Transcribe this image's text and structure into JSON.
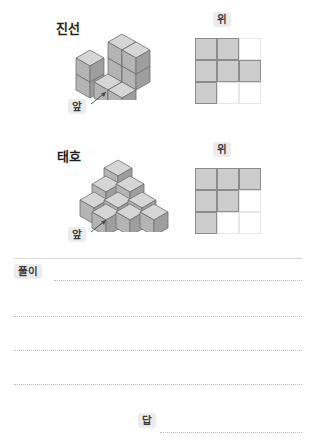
{
  "worksheet": {
    "problems": [
      {
        "student_name": "진선",
        "front_label": "앞",
        "top_label": "위",
        "top_view_grid": {
          "rows": 3,
          "cols": 3,
          "filled": [
            [
              true,
              true,
              false
            ],
            [
              true,
              true,
              true
            ],
            [
              true,
              false,
              false
            ]
          ]
        },
        "cube_count": 9
      },
      {
        "student_name": "태호",
        "front_label": "앞",
        "top_label": "위",
        "top_view_grid": {
          "rows": 3,
          "cols": 3,
          "filled": [
            [
              true,
              true,
              true
            ],
            [
              true,
              true,
              false
            ],
            [
              true,
              false,
              false
            ]
          ]
        },
        "cube_count": 10
      }
    ],
    "answer_area": {
      "solution_label": "풀이",
      "answer_label": "답",
      "solution_value": "",
      "answer_value": ""
    },
    "colors": {
      "cube_top": "#d6d6d6",
      "cube_left": "#b4b4b4",
      "cube_right": "#9e9e9e",
      "cube_stroke": "#6f6f6f",
      "grid_fill": "#cdcdcd",
      "grid_stroke": "#8c8c8c",
      "grid_faint": "#e6e6e6",
      "badge_bg": "#ececec",
      "text": "#231f20"
    }
  }
}
